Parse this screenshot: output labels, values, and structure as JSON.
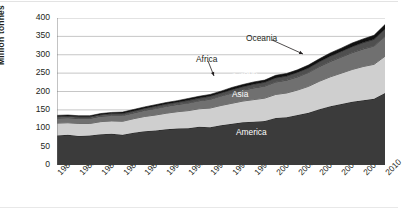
{
  "chart_data": {
    "type": "area",
    "stacked": true,
    "title": "",
    "xlabel": "",
    "ylabel": "Million tonnes",
    "ylim": [
      0,
      400
    ],
    "yticks": [
      0,
      50,
      100,
      150,
      200,
      250,
      300,
      350,
      400
    ],
    "xlim": [
      1980,
      2010
    ],
    "x": [
      1980,
      1981,
      1982,
      1983,
      1984,
      1985,
      1986,
      1987,
      1988,
      1989,
      1990,
      1991,
      1992,
      1993,
      1994,
      1995,
      1996,
      1997,
      1998,
      1999,
      2000,
      2001,
      2002,
      2003,
      2004,
      2005,
      2006,
      2007,
      2008,
      2009,
      2010
    ],
    "xtick_labels": [
      "1980",
      "1982",
      "1984",
      "1986",
      "1988",
      "1990",
      "1992",
      "1994",
      "1996",
      "1998",
      "2000",
      "2002",
      "2004",
      "2006",
      "2008",
      "2010"
    ],
    "xtick_step": 2,
    "minor_tick_step": 1,
    "grid": "horizontal",
    "legend": "inline-labels",
    "series": [
      {
        "name": "America",
        "color": "#3b3b3b",
        "label_position": "inside",
        "values": [
          80,
          82,
          79,
          80,
          84,
          85,
          82,
          88,
          92,
          94,
          97,
          99,
          100,
          104,
          103,
          108,
          112,
          116,
          118,
          120,
          128,
          130,
          136,
          142,
          152,
          160,
          166,
          172,
          176,
          180,
          196
        ]
      },
      {
        "name": "Asia",
        "color": "#cfcfcf",
        "label_position": "inside",
        "values": [
          34,
          33,
          34,
          33,
          34,
          35,
          37,
          38,
          40,
          42,
          44,
          46,
          48,
          49,
          52,
          54,
          56,
          58,
          60,
          62,
          64,
          66,
          68,
          72,
          76,
          80,
          84,
          88,
          92,
          94,
          100
        ]
      },
      {
        "name": "Europe",
        "color": "#707070",
        "label_position": "inside-rotated",
        "values": [
          14,
          14,
          14,
          14,
          15,
          15,
          16,
          16,
          17,
          18,
          19,
          20,
          21,
          22,
          24,
          26,
          28,
          30,
          32,
          33,
          34,
          35,
          36,
          38,
          40,
          42,
          44,
          46,
          48,
          50,
          54
        ]
      },
      {
        "name": "Africa",
        "color": "#4f4f4f",
        "label_position": "callout",
        "values": [
          4,
          4,
          4,
          4,
          4,
          5,
          5,
          5,
          5,
          6,
          6,
          6,
          7,
          7,
          8,
          8,
          9,
          9,
          10,
          10,
          11,
          11,
          12,
          12,
          13,
          14,
          15,
          16,
          17,
          18,
          20
        ]
      },
      {
        "name": "Oceania",
        "color": "#111111",
        "label_position": "callout",
        "values": [
          3,
          3,
          3,
          3,
          3,
          3,
          4,
          4,
          4,
          4,
          4,
          4,
          5,
          5,
          5,
          5,
          6,
          6,
          6,
          6,
          7,
          7,
          7,
          8,
          8,
          9,
          9,
          10,
          10,
          11,
          12
        ]
      }
    ],
    "annotations": [
      {
        "text": "Oceania",
        "target_series": "Oceania"
      },
      {
        "text": "Africa",
        "target_series": "Africa"
      },
      {
        "text": "Europe",
        "target_series": "Europe"
      },
      {
        "text": "Asia",
        "target_series": "Asia"
      },
      {
        "text": "America",
        "target_series": "America"
      }
    ]
  },
  "axis": {
    "y_label": "Million tonnes",
    "y_ticks": [
      "400",
      "350",
      "300",
      "250",
      "200",
      "150",
      "100",
      "50",
      "0"
    ],
    "x_ticks": [
      "1980",
      "1982",
      "1984",
      "1986",
      "1988",
      "1990",
      "1992",
      "1994",
      "1996",
      "1998",
      "2000",
      "2002",
      "2004",
      "2006",
      "2008",
      "2010"
    ]
  },
  "labels": {
    "oceania": "Oceania",
    "africa": "Africa",
    "europe": "Europe",
    "asia": "Asia",
    "america": "America"
  }
}
